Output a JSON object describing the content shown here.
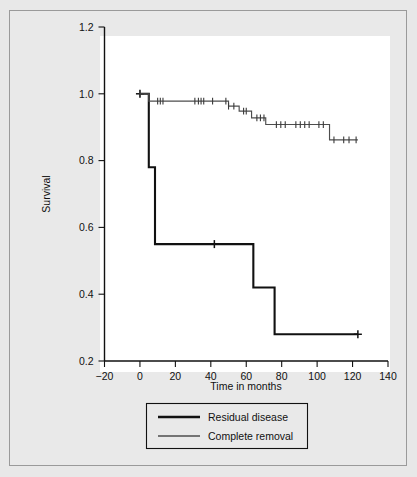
{
  "chart_data": {
    "type": "line",
    "title": "",
    "xlabel": "Time in months",
    "ylabel": "Survival",
    "xlim": [
      -20,
      140
    ],
    "ylim": [
      0.2,
      1.2
    ],
    "xticks": [
      -20,
      0,
      20,
      40,
      60,
      80,
      100,
      120,
      140
    ],
    "xtick_labels": [
      "−20",
      "0",
      "20",
      "40",
      "60",
      "80",
      "100",
      "120",
      "140"
    ],
    "yticks": [
      0.2,
      0.4,
      0.6,
      0.8,
      1.0,
      1.2
    ],
    "ytick_labels": [
      "0.2",
      "0.4",
      "0.6",
      "0.8",
      "1.0",
      "1.2"
    ],
    "grid": false,
    "legend_position": "below-axes",
    "series": [
      {
        "name": "Residual disease",
        "color": "#111111",
        "line_width": 2.1,
        "step_points": [
          [
            0,
            1.0
          ],
          [
            5,
            1.0
          ],
          [
            5,
            0.78
          ],
          [
            8.5,
            0.78
          ],
          [
            8.5,
            0.55
          ],
          [
            64,
            0.55
          ],
          [
            64,
            0.42
          ],
          [
            76,
            0.42
          ],
          [
            76,
            0.28
          ],
          [
            123,
            0.28
          ]
        ],
        "censor_times": [
          0,
          42,
          123
        ],
        "censor_values": [
          1.0,
          0.55,
          0.28
        ]
      },
      {
        "name": "Complete removal",
        "color": "#4d4d4d",
        "line_width": 1.15,
        "step_points": [
          [
            0,
            1.0
          ],
          [
            5,
            1.0
          ],
          [
            5,
            0.978
          ],
          [
            50,
            0.978
          ],
          [
            50,
            0.963
          ],
          [
            56,
            0.963
          ],
          [
            56,
            0.948
          ],
          [
            63,
            0.948
          ],
          [
            63,
            0.928
          ],
          [
            71,
            0.928
          ],
          [
            71,
            0.908
          ],
          [
            107,
            0.908
          ],
          [
            107,
            0.862
          ],
          [
            123,
            0.862
          ]
        ],
        "censor_times": [
          0,
          10,
          11.5,
          13,
          31,
          33,
          34.5,
          36,
          41,
          48.5,
          50,
          53,
          58.5,
          60,
          66,
          68,
          70,
          77,
          79.5,
          82,
          88,
          90.5,
          93,
          95.5,
          101,
          103.5,
          109.5,
          115,
          118,
          122
        ]
      }
    ]
  },
  "legend": {
    "items": [
      {
        "label": "Residual disease",
        "style": "thick-black"
      },
      {
        "label": "Complete removal",
        "style": "thin-gray"
      }
    ]
  },
  "colors": {
    "page_background": "#e8e8e8",
    "frame_border": "#9a9a9a",
    "plot_background": "#ffffff",
    "axis": "#111111",
    "residual_line": "#111111",
    "complete_line": "#4d4d4d"
  }
}
